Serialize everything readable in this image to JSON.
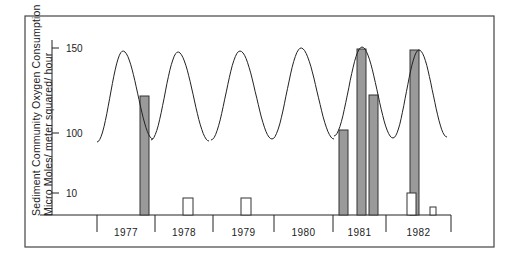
{
  "chart_data": {
    "type": "bar",
    "title": "",
    "ylabel_line1": "Sediment Community Oxygen Consumption",
    "ylabel_line2": "Micro Moles/ meter squared/ hour",
    "xlabel": "",
    "yticks": [
      {
        "label": "150",
        "value": 150
      },
      {
        "label": "100",
        "value": 100
      },
      {
        "label": "10",
        "value": 10
      }
    ],
    "categories": [
      "1977",
      "1978",
      "1979",
      "1980",
      "1981",
      "1982"
    ],
    "grid": false,
    "legend": null,
    "series": [
      {
        "name": "shaded bars",
        "style": "shaded",
        "points": [
          {
            "year": "1977",
            "value": 115
          },
          {
            "year": "1981",
            "value": 102
          },
          {
            "year": "1981",
            "value": 149
          },
          {
            "year": "1981",
            "value": 120
          },
          {
            "year": "1982",
            "value": 148
          }
        ]
      },
      {
        "name": "open bars",
        "style": "open",
        "points": [
          {
            "year": "1978",
            "value": 8
          },
          {
            "year": "1979",
            "value": 8
          },
          {
            "year": "1982",
            "value": 11
          },
          {
            "year": "1982",
            "value": 4
          }
        ]
      },
      {
        "name": "seasonal curve",
        "style": "line",
        "description": "one sinusoidal cycle per year, ranging roughly from ~95 (trough) to ~150 (peak)",
        "cycles": [
          {
            "year": "1977",
            "min": 95,
            "max": 148
          },
          {
            "year": "1978",
            "min": 95,
            "max": 148
          },
          {
            "year": "1979",
            "min": 95,
            "max": 148
          },
          {
            "year": "1980",
            "min": 95,
            "max": 150
          },
          {
            "year": "1981",
            "min": 96,
            "max": 150
          },
          {
            "year": "1982",
            "min": 96,
            "max": 149
          }
        ]
      }
    ]
  },
  "layout": {
    "frame": {
      "x": 25,
      "y": 16,
      "w": 469,
      "h": 231
    },
    "plot": {
      "axis_x": 52,
      "axis_top": 40,
      "baseline_y": 215,
      "baseline_x0": 40,
      "baseline_x1": 451
    },
    "tick_y": {
      "150": 48,
      "100": 133,
      "10": 193
    },
    "year_dividers": [
      97,
      155,
      213,
      274,
      333,
      386,
      451
    ],
    "year_label_y": 236,
    "bars": [
      {
        "x": 140,
        "w": 9,
        "top": 96,
        "style": "shaded"
      },
      {
        "x": 183,
        "w": 10,
        "top": 198,
        "style": "open"
      },
      {
        "x": 241,
        "w": 10,
        "top": 198,
        "style": "open"
      },
      {
        "x": 339,
        "w": 9,
        "top": 130,
        "style": "shaded"
      },
      {
        "x": 357,
        "w": 9,
        "top": 49,
        "style": "shaded"
      },
      {
        "x": 369,
        "w": 9,
        "top": 95,
        "style": "shaded"
      },
      {
        "x": 410,
        "w": 9,
        "top": 50,
        "style": "shaded"
      },
      {
        "x": 407,
        "w": 9,
        "top": 193,
        "style": "open"
      },
      {
        "x": 430,
        "w": 6,
        "top": 207,
        "style": "open"
      }
    ],
    "waves": [
      {
        "x0": 97,
        "y0": 142,
        "px": 123,
        "py": 51,
        "x1": 153,
        "y1": 139
      },
      {
        "x0": 151,
        "y0": 140,
        "px": 178,
        "py": 52,
        "x1": 209,
        "y1": 141
      },
      {
        "x0": 211,
        "y0": 140,
        "px": 240,
        "py": 51,
        "x1": 272,
        "y1": 139
      },
      {
        "x0": 272,
        "y0": 139,
        "px": 301,
        "py": 48,
        "x1": 334,
        "y1": 139
      },
      {
        "x0": 334,
        "y0": 136,
        "px": 362,
        "py": 47,
        "x1": 393,
        "y1": 138
      },
      {
        "x0": 393,
        "y0": 138,
        "px": 419,
        "py": 50,
        "x1": 447,
        "y1": 137
      }
    ]
  }
}
